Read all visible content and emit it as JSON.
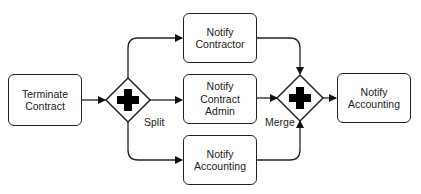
{
  "diagram": {
    "type": "bpmn-parallel-gateway-flow",
    "colors": {
      "stroke": "#222222",
      "fill": "#ffffff",
      "gateway_marker": "#000000"
    },
    "tasks": [
      {
        "id": "terminate",
        "label": "Terminate\nContract"
      },
      {
        "id": "contractor",
        "label": "Notify\nContractor"
      },
      {
        "id": "admin",
        "label": "Notify\nContract\nAdmin"
      },
      {
        "id": "accounting_branch",
        "label": "Notify\nAccounting"
      },
      {
        "id": "accounting_final",
        "label": "Notify\nAccounting"
      }
    ],
    "gateways": [
      {
        "id": "split",
        "label": "Split",
        "marker": "plus-icon"
      },
      {
        "id": "merge",
        "label": "Merge",
        "marker": "plus-icon"
      }
    ],
    "flows": [
      [
        "terminate",
        "split"
      ],
      [
        "split",
        "contractor"
      ],
      [
        "split",
        "admin"
      ],
      [
        "split",
        "accounting_branch"
      ],
      [
        "contractor",
        "merge"
      ],
      [
        "admin",
        "merge"
      ],
      [
        "accounting_branch",
        "merge"
      ],
      [
        "merge",
        "accounting_final"
      ]
    ]
  }
}
